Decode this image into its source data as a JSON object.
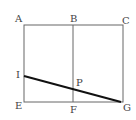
{
  "diagram": {
    "labels": {
      "A": "A",
      "B": "B",
      "C": "C",
      "I": "I",
      "P": "P",
      "E": "E",
      "F": "F",
      "G": "G"
    },
    "colors": {
      "frame": "#666666",
      "segment": "#111111"
    }
  }
}
